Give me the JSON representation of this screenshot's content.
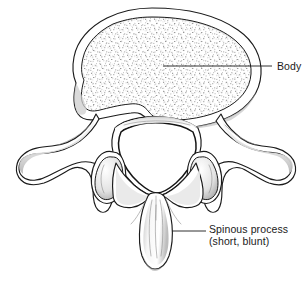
{
  "figure": {
    "background_color": "#ffffff",
    "line_color": "#1b1b1b",
    "shading_color": "#9a9a9a",
    "stipple_color": "#8c8c8c"
  },
  "labels": [
    {
      "id": "body",
      "text": "Body",
      "text_x": 277,
      "text_y": 70,
      "leader": {
        "x1": 163,
        "y1": 66,
        "x2": 272,
        "y2": 66
      },
      "target": "vertebral-body"
    },
    {
      "id": "spinous-process",
      "line1": "Spinous process",
      "line2": "(short, blunt)",
      "text_x": 209,
      "text_y": 233,
      "text_y2": 244,
      "leader": {
        "x1": 172,
        "y1": 231,
        "x2": 206,
        "y2": 231
      },
      "target": "spinous-process"
    }
  ],
  "structures": [
    {
      "id": "vertebral-body",
      "name": "Body"
    },
    {
      "id": "spinous-process",
      "name": "Spinous process (short, blunt)"
    },
    {
      "id": "transverse-process-left",
      "name": "Transverse process (left)"
    },
    {
      "id": "transverse-process-right",
      "name": "Transverse process (right)"
    },
    {
      "id": "superior-articular-process-left",
      "name": "Superior articular process (left)"
    },
    {
      "id": "superior-articular-process-right",
      "name": "Superior articular process (right)"
    },
    {
      "id": "vertebral-foramen",
      "name": "Vertebral foramen"
    },
    {
      "id": "lamina-left",
      "name": "Lamina (left)"
    },
    {
      "id": "lamina-right",
      "name": "Lamina (right)"
    }
  ]
}
